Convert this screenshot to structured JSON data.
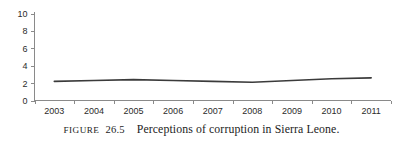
{
  "figure": {
    "label": "FIGURE",
    "number": "26.5",
    "caption_text": "Perceptions of corruption in Sierra Leone."
  },
  "chart_data": {
    "type": "line",
    "title": "",
    "subtitle": "",
    "xlabel": "",
    "ylabel": "",
    "categories": [
      "2003",
      "2004",
      "2005",
      "2006",
      "2007",
      "2008",
      "2009",
      "2010",
      "2011"
    ],
    "x": [
      2003,
      2004,
      2005,
      2006,
      2007,
      2008,
      2009,
      2010,
      2011
    ],
    "series": [
      {
        "name": "Perceptions of corruption",
        "values": [
          2.2,
          2.3,
          2.4,
          2.3,
          2.2,
          2.1,
          2.3,
          2.5,
          2.6
        ],
        "color": "#3b3b3b"
      }
    ],
    "ylim": [
      0,
      10
    ],
    "yticks": [
      0,
      2,
      4,
      6,
      8,
      10
    ],
    "ytick_labels": [
      "0",
      "2",
      "4",
      "6",
      "8",
      "10"
    ],
    "xtick_labels": [
      "2003",
      "2004",
      "2005",
      "2006",
      "2007",
      "2008",
      "2009",
      "2010",
      "2011"
    ],
    "grid": false,
    "legend": false,
    "legend_position": "none",
    "axis_color": "#8a8a8a",
    "text_color": "#2b2b2b"
  }
}
